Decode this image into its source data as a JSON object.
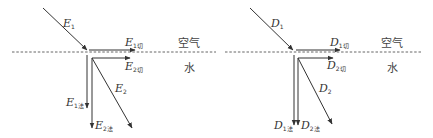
{
  "diagrams": [
    {
      "id": "E",
      "medium_top": "空气",
      "medium_bottom": "水",
      "labels": {
        "incident": {
          "main": "E",
          "sub": "1"
        },
        "tan1": {
          "main": "E",
          "sub": "1切"
        },
        "tan2": {
          "main": "E",
          "sub": "2切"
        },
        "norm1": {
          "main": "E",
          "sub": "1法"
        },
        "norm2": {
          "main": "E",
          "sub": "2法"
        },
        "refracted": {
          "main": "E",
          "sub": "2"
        }
      }
    },
    {
      "id": "D",
      "medium_top": "空气",
      "medium_bottom": "水",
      "labels": {
        "incident": {
          "main": "D",
          "sub": "1"
        },
        "tan1": {
          "main": "D",
          "sub": "1切"
        },
        "tan2": {
          "main": "D",
          "sub": "2切"
        },
        "norm1": {
          "main": "D",
          "sub": "1法"
        },
        "norm2": {
          "main": "D",
          "sub": "2法"
        },
        "refracted": {
          "main": "D",
          "sub": "2"
        }
      }
    }
  ],
  "colors": {
    "line": "#333333",
    "dashed": "#555555"
  }
}
